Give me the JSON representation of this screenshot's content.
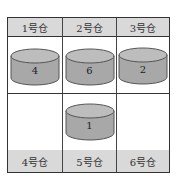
{
  "diagram": {
    "type": "warehouse-grid",
    "columns": 3,
    "top_labels": [
      "1号仓",
      "2号仓",
      "3号仓"
    ],
    "bottom_labels": [
      "4号仓",
      "5号仓",
      "6号仓"
    ],
    "top_row_cylinders": [
      {
        "warehouse": "1号仓",
        "value": "4"
      },
      {
        "warehouse": "2号仓",
        "value": "6"
      },
      {
        "warehouse": "3号仓",
        "value": "2"
      }
    ],
    "bottom_row_cylinders": [
      {
        "warehouse": "4号仓",
        "value": null
      },
      {
        "warehouse": "5号仓",
        "value": "1"
      },
      {
        "warehouse": "6号仓",
        "value": null
      }
    ],
    "colors": {
      "header_fill": "#d9d9d9",
      "cylinder_fill": "#a8a8a8",
      "cylinder_top": "#bdbdbd",
      "border": "#333333"
    }
  }
}
